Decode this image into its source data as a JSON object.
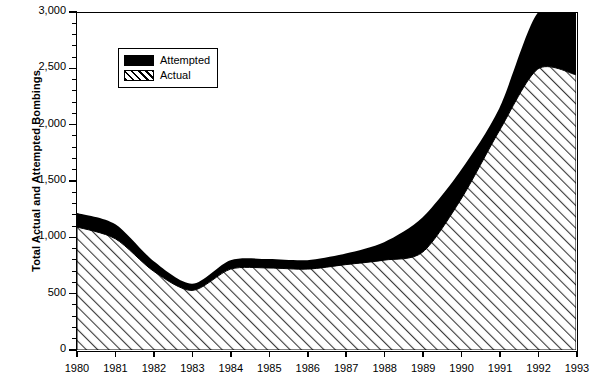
{
  "chart_data": {
    "type": "area",
    "title": "",
    "subtitle": "",
    "xlabel": "",
    "ylabel": "Total Actual and Attempted Bombings",
    "categories": [
      "1980",
      "1981",
      "1982",
      "1983",
      "1984",
      "1985",
      "1986",
      "1987",
      "1988",
      "1989",
      "1990",
      "1991",
      "1992",
      "1993"
    ],
    "x": [
      1980,
      1981,
      1982,
      1983,
      1984,
      1985,
      1986,
      1987,
      1988,
      1989,
      1990,
      1991,
      1992,
      1993
    ],
    "series": [
      {
        "name": "Attempted",
        "note": "upper boundary of stacked band (total actual + attempted)",
        "values": [
          1220,
          1120,
          790,
          590,
          800,
          810,
          800,
          860,
          960,
          1180,
          1600,
          2150,
          3000,
          3000
        ]
      },
      {
        "name": "Actual",
        "note": "lower hatched region (actual bombings)",
        "values": [
          1095,
          990,
          700,
          530,
          720,
          730,
          720,
          760,
          800,
          870,
          1340,
          1950,
          2500,
          2450
        ]
      }
    ],
    "ylim": [
      0,
      3000
    ],
    "xlim": [
      1980,
      1993
    ],
    "yticks": [
      0,
      500,
      1000,
      1500,
      2000,
      2500,
      3000
    ],
    "ytick_labels": [
      "0",
      "500",
      "1,000",
      "1,500",
      "2,000",
      "2,500",
      "3,000"
    ],
    "yminor_step": 100,
    "grid": false,
    "legend_position": "upper-left-inset",
    "legend_entries": [
      {
        "label": "Attempted",
        "swatch": "solid-black"
      },
      {
        "label": "Actual",
        "swatch": "diagonal-hatch"
      }
    ],
    "colors": {
      "attempted": "#000000",
      "actual_hatch": "#4a4a4a",
      "background": "#ffffff",
      "axis": "#000000"
    }
  }
}
